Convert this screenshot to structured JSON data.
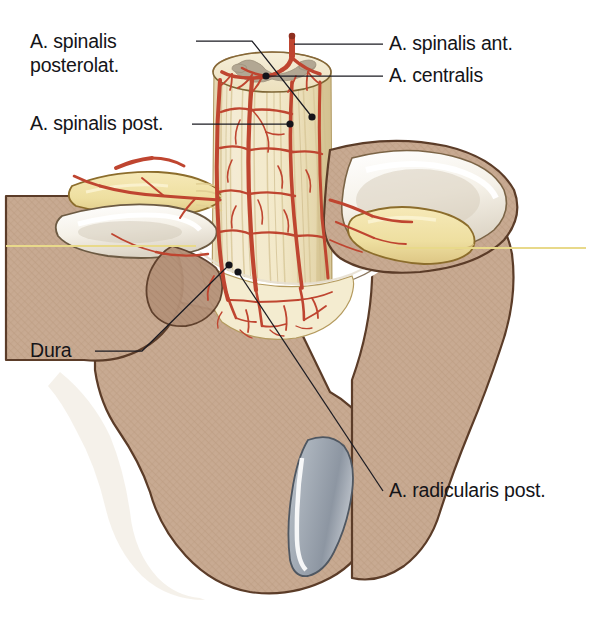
{
  "figure": {
    "title_fragment": "",
    "background_color": "#ffffff"
  },
  "labels": [
    {
      "id": "a-spinalis-posterolat",
      "name": "label-a-spinalis-posterolat",
      "lines": [
        "A. spinalis",
        "posterolat."
      ],
      "text": "A. spinalis posterolat.",
      "side": "left",
      "text_x": 30,
      "text_y": 48,
      "line_height": 24,
      "leader": "M 196 41 L 252 41 L 312 117",
      "dot": {
        "x": 312,
        "y": 117
      }
    },
    {
      "id": "a-spinalis-post",
      "name": "label-a-spinalis-post",
      "lines": [
        "A. spinalis post."
      ],
      "text": "A. spinalis post.",
      "side": "left",
      "text_x": 30,
      "text_y": 130,
      "line_height": 24,
      "leader": "M 192 124 L 290 124",
      "dot": {
        "x": 290,
        "y": 124
      }
    },
    {
      "id": "dura",
      "name": "label-dura",
      "lines": [
        "Dura"
      ],
      "text": "Dura",
      "side": "left",
      "text_x": 30,
      "text_y": 357,
      "line_height": 24,
      "leader": "M 95 351 L 142 351 L 229 265",
      "dot": {
        "x": 229,
        "y": 265
      }
    },
    {
      "id": "a-spinalis-ant",
      "name": "label-a-spinalis-ant",
      "lines": [
        "A. spinalis ant."
      ],
      "text": "A. spinalis ant.",
      "side": "right",
      "text_x": 389,
      "text_y": 50,
      "line_height": 24,
      "leader": "M 383 44 L 294 44",
      "dot": {
        "x": 294,
        "y": 44
      }
    },
    {
      "id": "a-centralis",
      "name": "label-a-centralis",
      "lines": [
        "A. centralis"
      ],
      "text": "A. centralis",
      "side": "right",
      "text_x": 389,
      "text_y": 82,
      "line_height": 24,
      "leader": "M 383 76 L 266 76",
      "dot": {
        "x": 266,
        "y": 76
      }
    },
    {
      "id": "a-radicularis-post",
      "name": "label-a-radicularis-post",
      "lines": [
        "A. radicularis post."
      ],
      "text": "A. radicularis post.",
      "side": "right",
      "text_x": 389,
      "text_y": 497,
      "line_height": 24,
      "leader": "M 383 491 L 238 272",
      "dot": {
        "x": 238,
        "y": 272
      }
    }
  ],
  "anatomy": {
    "structures": [
      {
        "name": "spinal-cord",
        "label": "Spinal cord (medulla spinalis)",
        "color": "#f2e8cb"
      },
      {
        "name": "gray-matter",
        "label": "Gray matter (butterfly)",
        "color": "#b6ab97"
      },
      {
        "name": "vertebra-body",
        "label": "Vertebral body and arch",
        "color": "#c5a68e"
      },
      {
        "name": "articular-cartilage",
        "label": "Articular cartilage / facet",
        "color": "#f7f4ee"
      },
      {
        "name": "nerve-root",
        "label": "Spinal nerve root / ganglion",
        "color": "#efdca2"
      },
      {
        "name": "intervertebral-disc",
        "label": "Ligament / disc remnant",
        "color": "#98a0ab"
      },
      {
        "name": "dura-mater",
        "label": "Dura mater",
        "color": "#ffffff"
      },
      {
        "name": "arteries",
        "label": "Arteries",
        "color": "#bf4530"
      },
      {
        "name": "section-plane-line",
        "label": "Horizontal section plane",
        "color": "#e8d98a"
      }
    ]
  },
  "colors": {
    "artery": "#bf4530",
    "artery_dark": "#8e2f20",
    "bone": "#c5a68e",
    "bone_outline": "#5a3b27",
    "cord": "#f2e8cb",
    "cord_stripe": "#ddcfa0",
    "gray_matter": "#b6ab97",
    "cartilage": "#f8f5ef",
    "nerve": "#efdca2",
    "nerve_outline": "#9a7a33",
    "ligament": "#98a0ab",
    "section_line": "#e8d98a",
    "label_text": "#141418",
    "leader_line": "#1b1b22",
    "background": "#ffffff"
  }
}
